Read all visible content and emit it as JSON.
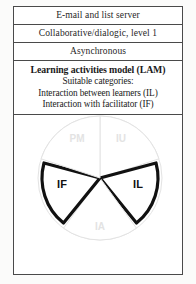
{
  "figure": {
    "rows": [
      {
        "label": "E-mail and list server"
      },
      {
        "label": "Collaborative/dialogic, level 1"
      },
      {
        "label": "Asynchronous"
      }
    ],
    "lam": {
      "title": "Learning activities model (LAM)",
      "subtitle": "Suitable categories:",
      "categories": [
        "Interaction between learners (IL)",
        "Interaction with facilitator (IF)"
      ]
    },
    "pie": {
      "type": "pie",
      "center": {
        "x": 86,
        "y": 63
      },
      "radius": 62,
      "highlight_color": "#111111",
      "faint_color": "#e3e3e3",
      "sectors": [
        {
          "label": "IU",
          "start_deg": -90,
          "end_deg": -18,
          "emphasis": "faint",
          "label_x": 107,
          "label_y": 24
        },
        {
          "label": "IL",
          "start_deg": -18,
          "end_deg": 54,
          "emphasis": "bold",
          "label_x": 124,
          "label_y": 70
        },
        {
          "label": "IA",
          "start_deg": 54,
          "end_deg": 126,
          "emphasis": "faint",
          "label_x": 86,
          "label_y": 112
        },
        {
          "label": "IF",
          "start_deg": 126,
          "end_deg": 198,
          "emphasis": "bold",
          "label_x": 48,
          "label_y": 70
        },
        {
          "label": "PM",
          "start_deg": 198,
          "end_deg": 270,
          "emphasis": "faint",
          "label_x": 63,
          "label_y": 24
        }
      ]
    }
  }
}
